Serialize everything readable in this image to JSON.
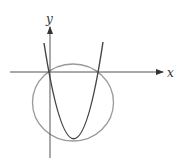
{
  "figure": {
    "x_label": "x",
    "y_label": "y",
    "elements": [
      "parabola",
      "circle",
      "x-axis",
      "y-axis"
    ]
  },
  "colors": {
    "axis": "#555555",
    "parabola": "#444444",
    "circle": "#999999",
    "background": "#ffffff"
  }
}
